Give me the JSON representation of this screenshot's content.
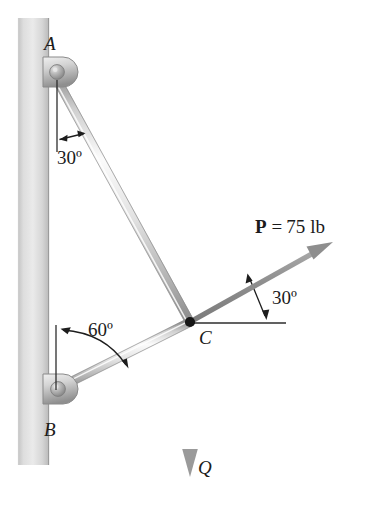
{
  "figure": {
    "type": "statics-free-body-diagram",
    "background_color": "#ffffff",
    "wall": {
      "label": "vertical-wall",
      "fill_light": "#e8e8e8",
      "fill_dark": "#bdbdbd"
    },
    "points": [
      {
        "id": "A",
        "label": "A",
        "x": 52,
        "y": 72,
        "label_x": 44,
        "label_y": 34
      },
      {
        "id": "B",
        "label": "B",
        "x": 54,
        "y": 390,
        "label_x": 44,
        "label_y": 420
      },
      {
        "id": "C",
        "label": "C",
        "x": 190,
        "y": 322,
        "label_x": 199,
        "label_y": 328
      }
    ],
    "members": [
      {
        "id": "AC",
        "from": "A",
        "to": "C",
        "color": "#c9c9c9"
      },
      {
        "id": "BC",
        "from": "B",
        "to": "C",
        "color": "#c9c9c9"
      }
    ],
    "angles": [
      {
        "id": "angle-at-A",
        "value": "30º",
        "reference": "vertical",
        "label_x": 57,
        "label_y": 148
      },
      {
        "id": "angle-at-B",
        "value": "60º",
        "reference": "vertical",
        "label_x": 88,
        "label_y": 320
      },
      {
        "id": "angle-at-C",
        "value": "30º",
        "reference": "horizontal",
        "label_x": 272,
        "label_y": 288
      }
    ],
    "forces": [
      {
        "id": "force-P",
        "symbol": "P",
        "equals": "=",
        "magnitude": "75",
        "unit": "lb",
        "full_label": "P = 75 lb",
        "color": "#8c8c8c",
        "label_x": 255,
        "label_y": 217,
        "direction_deg_from_horizontal": 30
      },
      {
        "id": "force-Q",
        "symbol": "Q",
        "full_label": "Q",
        "color": "#9a9a9a",
        "label_x": 198,
        "label_y": 458,
        "direction": "vertical-down"
      }
    ],
    "colors": {
      "rod_light": "#f2f2f2",
      "rod_mid": "#c4c4c4",
      "rod_dark": "#9d9d9d",
      "bracket_light": "#e4e4e4",
      "bracket_dark": "#a8a8a8",
      "arrow_gray": "#949494",
      "text": "#1b1b1b",
      "guide_line": "#4a4a4a"
    }
  }
}
